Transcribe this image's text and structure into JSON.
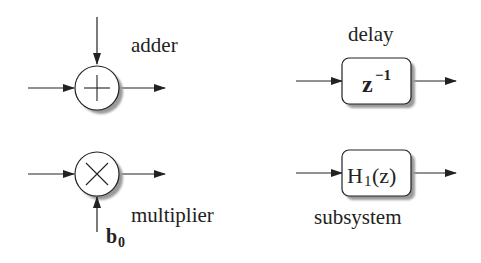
{
  "diagram": {
    "elements": {
      "adder": {
        "label": "adder",
        "symbol": "+"
      },
      "delay": {
        "label": "delay",
        "box_text_base": "z",
        "box_text_sup": "−1"
      },
      "multiplier": {
        "label": "multiplier",
        "symbol": "×",
        "coef_base": "b",
        "coef_sub": "0"
      },
      "subsystem": {
        "label": "subsystem",
        "box_text_base": "H",
        "box_text_sub": "1",
        "box_text_tail": "(z)"
      }
    },
    "colors": {
      "stroke": "#222222",
      "shadow": "#9a9a9a",
      "background": "#ffffff"
    }
  }
}
